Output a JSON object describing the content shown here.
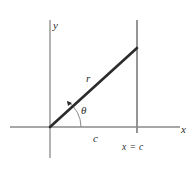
{
  "figure": {
    "type": "geometry-diagram",
    "background_color": "#ffffff",
    "axis_color": "#8a8a8a",
    "ray_color": "#2b2b2b",
    "label_color": "#2b2b2b",
    "labels": {
      "y_axis": "y",
      "x_axis": "x",
      "radius": "r",
      "angle": "θ",
      "base_segment": "c",
      "vertical_line": "x = c"
    },
    "geometry": {
      "origin": {
        "x": 50,
        "y": 127
      },
      "x_axis_start": {
        "x": 10,
        "y": 127
      },
      "x_axis_end": {
        "x": 180,
        "y": 127
      },
      "y_axis_top": {
        "x": 50,
        "y": 20
      },
      "y_axis_bottom": {
        "x": 50,
        "y": 158
      },
      "vertical_line_x": 137,
      "vertical_line_top": {
        "x": 137,
        "y": 20
      },
      "vertical_line_bottom": {
        "x": 137,
        "y": 133
      },
      "ray_start": {
        "x": 50,
        "y": 127
      },
      "ray_end": {
        "x": 137,
        "y": 48
      },
      "arc_radius": 31
    },
    "label_positions": {
      "y_axis": {
        "x": 53,
        "y": 29
      },
      "x_axis": {
        "x": 181,
        "y": 133
      },
      "radius": {
        "x": 86,
        "y": 82
      },
      "angle": {
        "x": 81,
        "y": 114
      },
      "base_segment": {
        "x": 93,
        "y": 142
      },
      "vertical_line": {
        "x": 122,
        "y": 150
      }
    }
  }
}
